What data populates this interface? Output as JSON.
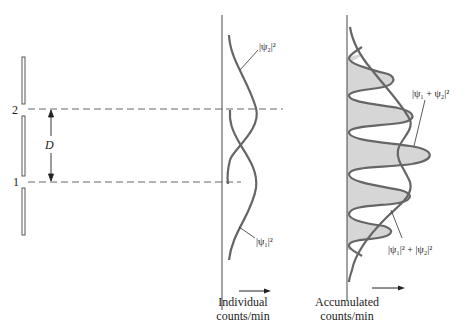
{
  "slit_barrier": {
    "slit_labels": [
      "2",
      "1"
    ],
    "separation_label": "D"
  },
  "individual_panel": {
    "axis_label_line1": "Individual",
    "axis_label_line2": "counts/min",
    "curve_labels": {
      "psi2": "|ψ₂|²",
      "psi1": "|ψ₁|²"
    }
  },
  "accumulated_panel": {
    "axis_label_line1": "Accumulated",
    "axis_label_line2": "counts/min",
    "curve_labels": {
      "interference": "|ψ₁ + ψ₂|²",
      "classical_sum": "|ψ₁|² + |ψ₂|²"
    }
  },
  "colors": {
    "curve": "#666666",
    "line": "#333333",
    "fill": "#d6d6d6",
    "text": "#222222"
  }
}
